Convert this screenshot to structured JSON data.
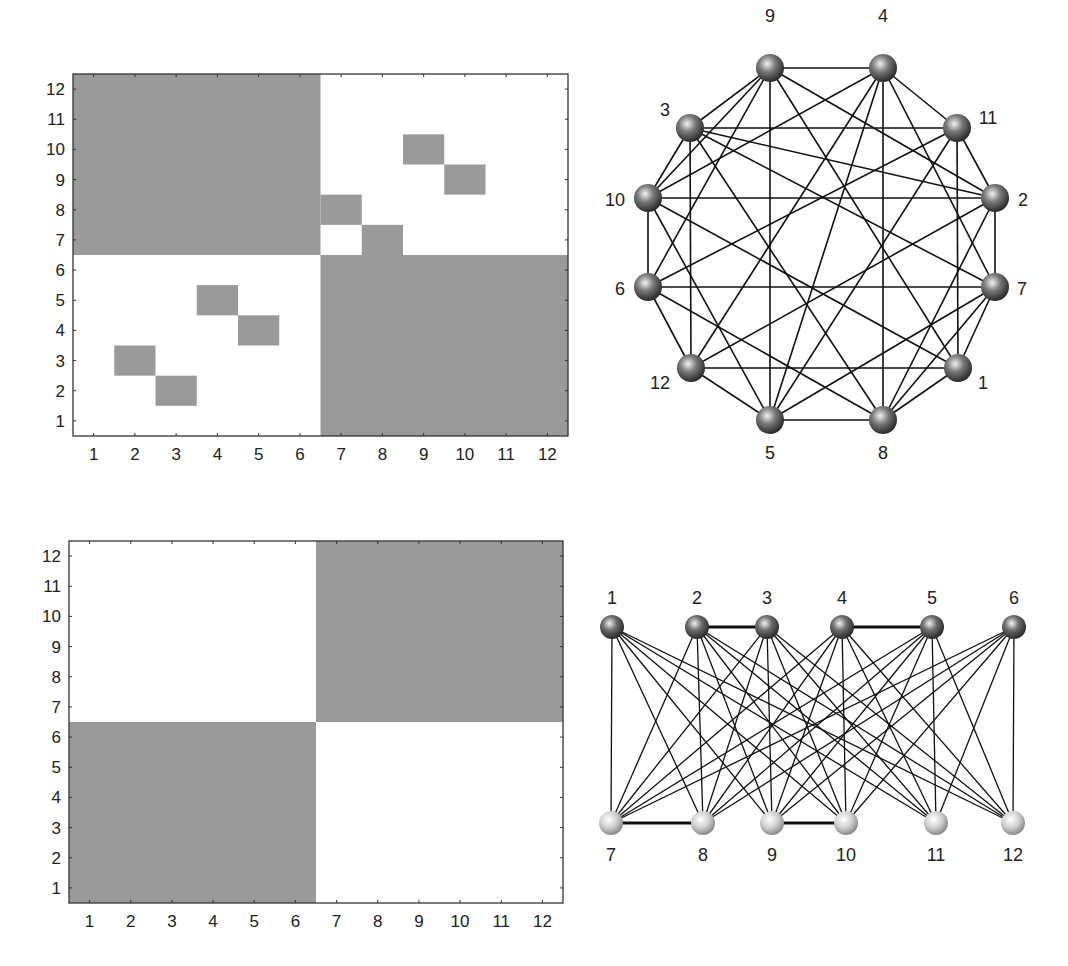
{
  "colors": {
    "cell_fill": "#9a9a9a",
    "background": "#ffffff",
    "axis": "#333333",
    "edge": "#111111",
    "node_dark": "#5a5a5a",
    "node_light": "#c8c8c8"
  },
  "chart_data": [
    {
      "type": "heatmap",
      "title": "",
      "description": "Adjacency matrix of 12-node graph (circular layout); filled cell = edge",
      "x_ticks": [
        "1",
        "2",
        "3",
        "4",
        "5",
        "6",
        "7",
        "8",
        "9",
        "10",
        "11",
        "12"
      ],
      "y_ticks": [
        "1",
        "2",
        "3",
        "4",
        "5",
        "6",
        "7",
        "8",
        "9",
        "10",
        "11",
        "12"
      ],
      "xlim": [
        0.5,
        12.5
      ],
      "ylim": [
        0.5,
        12.5
      ],
      "filled_blocks": [
        {
          "cols": [
            1,
            6
          ],
          "rows": [
            7,
            12
          ]
        },
        {
          "cols": [
            7,
            12
          ],
          "rows": [
            1,
            6
          ]
        }
      ],
      "filled_cells": [
        {
          "col": 2,
          "row": 3
        },
        {
          "col": 3,
          "row": 2
        },
        {
          "col": 4,
          "row": 5
        },
        {
          "col": 5,
          "row": 4
        },
        {
          "col": 7,
          "row": 8
        },
        {
          "col": 8,
          "row": 7
        },
        {
          "col": 9,
          "row": 10
        },
        {
          "col": 10,
          "row": 9
        }
      ]
    },
    {
      "type": "heatmap",
      "title": "",
      "description": "Block structure of the reordered adjacency (complete bipartite)",
      "x_ticks": [
        "1",
        "2",
        "3",
        "4",
        "5",
        "6",
        "7",
        "8",
        "9",
        "10",
        "11",
        "12"
      ],
      "y_ticks": [
        "1",
        "2",
        "3",
        "4",
        "5",
        "6",
        "7",
        "8",
        "9",
        "10",
        "11",
        "12"
      ],
      "xlim": [
        0.5,
        12.5
      ],
      "ylim": [
        0.5,
        12.5
      ],
      "filled_blocks": [
        {
          "cols": [
            1,
            6
          ],
          "rows": [
            1,
            6
          ]
        },
        {
          "cols": [
            7,
            12
          ],
          "rows": [
            7,
            12
          ]
        }
      ],
      "filled_cells": []
    }
  ],
  "graphs": {
    "circular": {
      "nodes": [
        {
          "id": "9",
          "x": 770,
          "y": 68,
          "lx": 770,
          "ly": 22,
          "anchor": "middle"
        },
        {
          "id": "4",
          "x": 883,
          "y": 68,
          "lx": 883,
          "ly": 22,
          "anchor": "middle"
        },
        {
          "id": "11",
          "x": 957,
          "y": 128,
          "lx": 988,
          "ly": 124,
          "anchor": "middle"
        },
        {
          "id": "2",
          "x": 995,
          "y": 198,
          "lx": 1023,
          "ly": 206,
          "anchor": "middle"
        },
        {
          "id": "7",
          "x": 995,
          "y": 287,
          "lx": 1022,
          "ly": 295,
          "anchor": "middle"
        },
        {
          "id": "1",
          "x": 958,
          "y": 368,
          "lx": 983,
          "ly": 389,
          "anchor": "middle"
        },
        {
          "id": "8",
          "x": 883,
          "y": 420,
          "lx": 883,
          "ly": 459,
          "anchor": "middle"
        },
        {
          "id": "5",
          "x": 770,
          "y": 420,
          "lx": 770,
          "ly": 459,
          "anchor": "middle"
        },
        {
          "id": "12",
          "x": 691,
          "y": 368,
          "lx": 660,
          "ly": 389,
          "anchor": "middle"
        },
        {
          "id": "6",
          "x": 648,
          "y": 287,
          "lx": 620,
          "ly": 295,
          "anchor": "middle"
        },
        {
          "id": "10",
          "x": 648,
          "y": 198,
          "lx": 615,
          "ly": 206,
          "anchor": "middle"
        },
        {
          "id": "3",
          "x": 690,
          "y": 128,
          "lx": 665,
          "ly": 116,
          "anchor": "middle"
        }
      ]
    },
    "bipartite": {
      "top_nodes": [
        {
          "id": "1",
          "x": 612,
          "y": 627
        },
        {
          "id": "2",
          "x": 697,
          "y": 627
        },
        {
          "id": "3",
          "x": 767,
          "y": 627
        },
        {
          "id": "4",
          "x": 842,
          "y": 627
        },
        {
          "id": "5",
          "x": 932,
          "y": 627
        },
        {
          "id": "6",
          "x": 1014,
          "y": 627
        }
      ],
      "bottom_nodes": [
        {
          "id": "7",
          "x": 611,
          "y": 823
        },
        {
          "id": "8",
          "x": 703,
          "y": 823
        },
        {
          "id": "9",
          "x": 772,
          "y": 823
        },
        {
          "id": "10",
          "x": 846,
          "y": 823
        },
        {
          "id": "11",
          "x": 936,
          "y": 823
        },
        {
          "id": "12",
          "x": 1013,
          "y": 823
        }
      ],
      "thick_edges": [
        [
          "2",
          "3"
        ],
        [
          "4",
          "5"
        ],
        [
          "7",
          "8"
        ],
        [
          "9",
          "10"
        ]
      ]
    },
    "edges_description": "All pairs (i in 1..6, j in 7..12) plus 2-3, 4-5, 7-8, 9-10"
  }
}
